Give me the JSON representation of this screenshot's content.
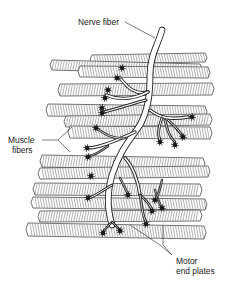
{
  "figure": {
    "labels": {
      "nerve_fiber": "Nerve fiber",
      "muscle_fibers_line1": "Muscle",
      "muscle_fibers_line2": "fibers",
      "motor_end_plates_line1": "Motor",
      "motor_end_plates_line2": "end plates"
    },
    "colors": {
      "ink": "#222222",
      "background": "#ffffff"
    },
    "structure": {
      "muscle_fiber_count": 12,
      "motor_end_plate_count": 22,
      "nerve_main_branches": 3
    }
  }
}
